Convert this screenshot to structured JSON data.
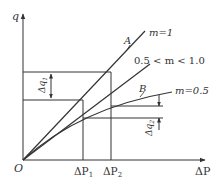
{
  "diagram": {
    "type": "flow-pressure characteristic",
    "axes": {
      "y_label": "q",
      "x_label": "ΔP",
      "origin_label": "O"
    },
    "x_ticks": [
      {
        "base": "ΔP",
        "sub": "1"
      },
      {
        "base": "ΔP",
        "sub": "2"
      }
    ],
    "curves": [
      {
        "id": "A",
        "point_label": "A",
        "label": "m=1"
      },
      {
        "id": "mid",
        "label": "0.5 < m < 1.0"
      },
      {
        "id": "B",
        "point_label": "B",
        "label": "m=0.5"
      }
    ],
    "dimensions": [
      {
        "base": "Δq",
        "sub": "1"
      },
      {
        "base": "Δq",
        "sub": "2"
      }
    ],
    "colors": {
      "line": "#333333",
      "background": "#ffffff"
    }
  }
}
